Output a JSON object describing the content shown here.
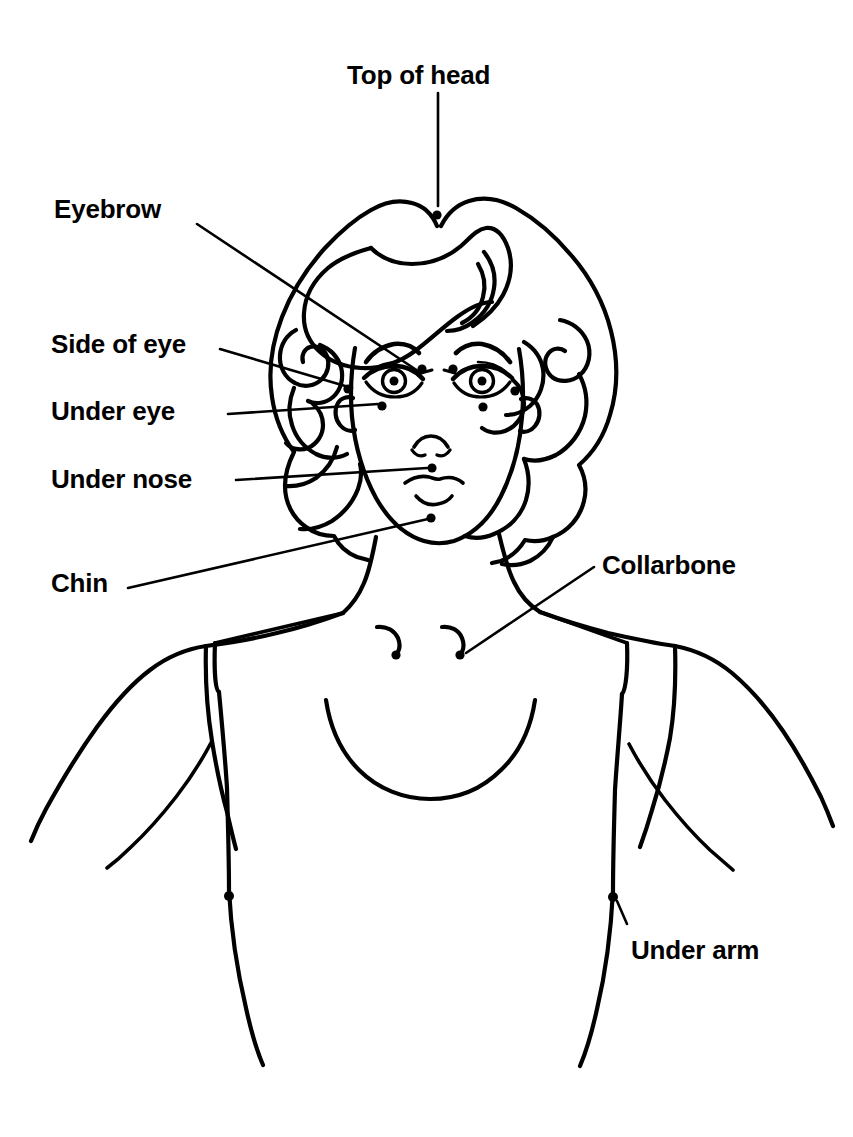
{
  "figure": {
    "line_color": "#000000",
    "background_color": "#ffffff",
    "point_color": "#000000",
    "canvas": {
      "width": 853,
      "height": 1137
    }
  },
  "labels": [
    {
      "id": "top-of-head",
      "text": "Top of head",
      "x": 347,
      "y": 62,
      "align": "left"
    },
    {
      "id": "eyebrow",
      "text": "Eyebrow",
      "x": 54,
      "y": 196,
      "align": "left"
    },
    {
      "id": "side-of-eye",
      "text": "Side of eye",
      "x": 51,
      "y": 331,
      "align": "left"
    },
    {
      "id": "under-eye",
      "text": "Under eye",
      "x": 51,
      "y": 398,
      "align": "left"
    },
    {
      "id": "under-nose",
      "text": "Under nose",
      "x": 51,
      "y": 466,
      "align": "left"
    },
    {
      "id": "chin",
      "text": "Chin",
      "x": 51,
      "y": 570,
      "align": "left"
    },
    {
      "id": "collarbone",
      "text": "Collarbone",
      "x": 602,
      "y": 552,
      "align": "left"
    },
    {
      "id": "under-arm",
      "text": "Under arm",
      "x": 631,
      "y": 937,
      "align": "left"
    }
  ],
  "tapping_points": [
    {
      "id": "top-of-head-point",
      "label": "Top of head",
      "cx": 437,
      "cy": 215,
      "r": 4.6
    },
    {
      "id": "eyebrow-left-point",
      "label": "Eyebrow",
      "cx": 422,
      "cy": 369,
      "r": 4.6
    },
    {
      "id": "eyebrow-right-point",
      "label": "Eyebrow",
      "cx": 453,
      "cy": 369,
      "r": 4.6
    },
    {
      "id": "side-of-eye-left",
      "label": "Side of eye",
      "cx": 348,
      "cy": 389,
      "r": 4.6
    },
    {
      "id": "side-of-eye-right",
      "label": "Side of eye",
      "cx": 515,
      "cy": 391,
      "r": 4.6
    },
    {
      "id": "under-eye-left",
      "label": "Under eye",
      "cx": 382,
      "cy": 406,
      "r": 4.6
    },
    {
      "id": "under-eye-right",
      "label": "Under eye",
      "cx": 483,
      "cy": 407,
      "r": 4.6
    },
    {
      "id": "under-nose-point",
      "label": "Under nose",
      "cx": 432,
      "cy": 468,
      "r": 4.6
    },
    {
      "id": "chin-point",
      "label": "Chin",
      "cx": 431,
      "cy": 518,
      "r": 4.6
    },
    {
      "id": "collarbone-left",
      "label": "Collarbone",
      "cx": 396,
      "cy": 655,
      "r": 4.6
    },
    {
      "id": "collarbone-right",
      "label": "Collarbone",
      "cx": 460,
      "cy": 655,
      "r": 4.6
    },
    {
      "id": "under-arm-left",
      "label": "Under arm",
      "cx": 229,
      "cy": 896,
      "r": 5.0
    },
    {
      "id": "under-arm-right",
      "label": "Under arm",
      "cx": 613,
      "cy": 897,
      "r": 5.0
    }
  ],
  "leader_lines": [
    {
      "id": "leader-top-of-head",
      "label": "Top of head",
      "points": "438,93 438,206"
    },
    {
      "id": "leader-eyebrow",
      "label": "Eyebrow",
      "points": "197,224 418,371"
    },
    {
      "id": "leader-side-of-eye",
      "label": "Side of eye",
      "points": "220,349 352,388"
    },
    {
      "id": "leader-under-eye",
      "label": "Under eye",
      "points": "228,414 378,404"
    },
    {
      "id": "leader-under-nose",
      "label": "Under nose",
      "points": "236,480 427,468"
    },
    {
      "id": "leader-chin",
      "label": "Chin",
      "points": "128,588 428,519"
    },
    {
      "id": "leader-collarbone",
      "label": "Collarbone",
      "points": "594,567 466,653"
    },
    {
      "id": "leader-under-arm",
      "label": "Under arm",
      "points": "627,924 617,901"
    }
  ]
}
